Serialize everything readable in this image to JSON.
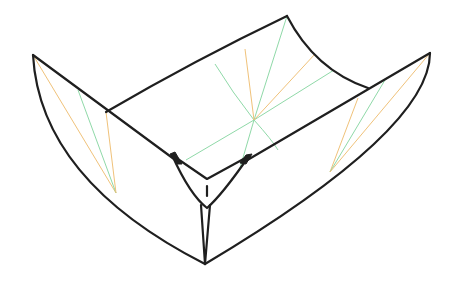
{
  "diagram": {
    "colors": {
      "outline": "#1f1f1f",
      "valley_crease": "#8fd9a8",
      "mountain_crease": "#f0c27a",
      "background": "#ffffff"
    },
    "parts": [
      {
        "name": "back-panel",
        "label": "Back curved panel"
      },
      {
        "name": "left-flap",
        "label": "Left curved flap"
      },
      {
        "name": "right-flap",
        "label": "Right curved flap"
      },
      {
        "name": "front-corner",
        "label": "Front folded corner"
      }
    ]
  }
}
